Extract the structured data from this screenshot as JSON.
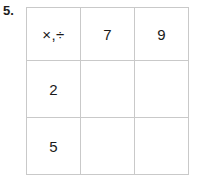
{
  "exercise": {
    "number_label": "5."
  },
  "grid": {
    "operation_header": "×,÷",
    "column_headers": [
      "7",
      "9"
    ],
    "row_headers": [
      "2",
      "5"
    ],
    "rows": [
      {
        "header": "×,÷",
        "cells": [
          "7",
          "9"
        ]
      },
      {
        "header": "2",
        "cells": [
          "",
          ""
        ]
      },
      {
        "header": "5",
        "cells": [
          "",
          ""
        ]
      }
    ]
  },
  "style": {
    "outer_border_color": "#8c8c8c",
    "inner_border_color": "#c9c9c9",
    "text_color": "#1a1a1a",
    "background_color": "#ffffff"
  }
}
